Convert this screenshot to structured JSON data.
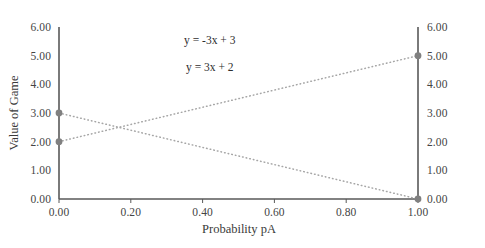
{
  "chart_data": {
    "type": "line",
    "title": "",
    "xlabel": "Probability pA",
    "ylabel": "Value of Game",
    "ylabel_right": "",
    "xlim": [
      0.0,
      1.0
    ],
    "ylim": [
      0.0,
      6.0
    ],
    "grid": false,
    "legend": "none",
    "dual_y_axis": true,
    "x_ticks": [
      0.0,
      0.2,
      0.4,
      0.6,
      0.8,
      1.0
    ],
    "x_tick_labels": [
      "0.00",
      "0.20",
      "0.40",
      "0.60",
      "0.80",
      "1.00"
    ],
    "y_ticks": [
      0.0,
      1.0,
      2.0,
      3.0,
      4.0,
      5.0,
      6.0
    ],
    "y_tick_labels": [
      "0.00",
      "1.00",
      "2.00",
      "3.00",
      "4.00",
      "5.00",
      "6.00"
    ],
    "y_ticks_right": [
      0.0,
      1.0,
      2.0,
      3.0,
      4.0,
      5.0,
      6.0
    ],
    "y_tick_labels_right": [
      "0.00",
      "1.00",
      "2.00",
      "3.00",
      "4.00",
      "5.00",
      "6.00"
    ],
    "series": [
      {
        "name": "y = -3x + 3",
        "x": [
          0.0,
          1.0
        ],
        "values": [
          3.0,
          0.0
        ],
        "style": "dotted",
        "color": "#a6a6a6",
        "marker": "circle",
        "marker_color": "#808080"
      },
      {
        "name": "y = 3x + 2",
        "x": [
          0.0,
          1.0
        ],
        "values": [
          2.0,
          5.0
        ],
        "style": "dotted",
        "color": "#a6a6a6",
        "marker": "circle",
        "marker_color": "#808080"
      }
    ],
    "annotations": [
      {
        "text": "y = -3x + 3",
        "x": 0.42,
        "y": 5.55
      },
      {
        "text": "y = 3x + 2",
        "x": 0.42,
        "y": 4.6
      }
    ],
    "colors": {
      "line": "#a6a6a6",
      "marker": "#808080",
      "axis": "#595959",
      "text": "#3f3f3f",
      "background": "#ffffff"
    }
  }
}
